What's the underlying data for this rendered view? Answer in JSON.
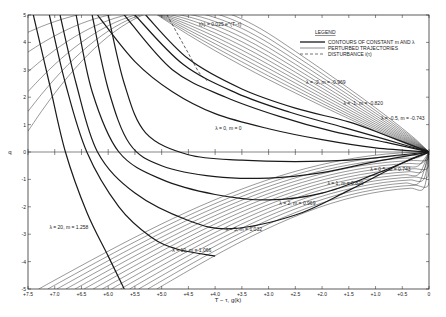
{
  "chart_data": {
    "type": "line",
    "title": "",
    "xlabel": "T − τ, g(k)",
    "ylabel": "q",
    "xlim": [
      7.5,
      0
    ],
    "ylim": [
      -5,
      5
    ],
    "x_ticks": [
      "+7.5",
      "+7.0",
      "+6.5",
      "+6.0",
      "+5.5",
      "+5.0",
      "+4.5",
      "+4.0",
      "+3.5",
      "+3.0",
      "+2.5",
      "+2.0",
      "+1.5",
      "+1.0",
      "+0.5",
      "0"
    ],
    "x_tick_values": [
      7.5,
      7.0,
      6.5,
      6.0,
      5.5,
      5.0,
      4.5,
      4.0,
      3.5,
      3.0,
      2.5,
      2.0,
      1.5,
      1.0,
      0.5,
      0
    ],
    "y_ticks": [
      "5",
      "4",
      "3",
      "2",
      "1",
      "0",
      "-1",
      "-2",
      "-3",
      "-4",
      "-5"
    ],
    "y_tick_values": [
      5,
      4,
      3,
      2,
      1,
      0,
      -1,
      -2,
      -3,
      -4,
      -5
    ],
    "grid": false,
    "legend": {
      "title": "LEGEND",
      "position": "upper right",
      "entries": [
        {
          "label": "CONTOURS OF CONSTANT m AND λ",
          "style": "thick-solid"
        },
        {
          "label": "PERTURBED TRAJECTORIES",
          "style": "thin-solid"
        },
        {
          "label": "DISTURBANCE i(τ)",
          "style": "dashed"
        }
      ]
    },
    "annotations": [
      {
        "text": "i(τ) = 0.025 e^(T−τ)",
        "x": 4.3,
        "y": 4.6
      },
      {
        "text": "λ = -2, m = -0.969",
        "x": 2.3,
        "y": 2.5
      },
      {
        "text": "λ = -1, m = -0.820",
        "x": 1.6,
        "y": 1.7
      },
      {
        "text": "λ = -0.5, m = -0.743",
        "x": 0.9,
        "y": 1.15
      },
      {
        "text": "λ = 0, m = 0",
        "x": 4.0,
        "y": 0.8
      },
      {
        "text": "λ = 0.5, m = 0.743",
        "x": 1.1,
        "y": -0.7
      },
      {
        "text": "λ = 1, m = 0.820",
        "x": 1.9,
        "y": -1.2
      },
      {
        "text": "λ = 2, m = 0.969",
        "x": 2.8,
        "y": -1.95
      },
      {
        "text": "λ = 5, m = 1.032",
        "x": 3.8,
        "y": -2.9
      },
      {
        "text": "λ = 10, m = 1.066",
        "x": 4.8,
        "y": -3.65
      },
      {
        "text": "λ = 20, m = 1.258",
        "x": 7.1,
        "y": -2.8
      }
    ],
    "series": [
      {
        "name": "λ = -0.5, m = -0.743",
        "kind": "contour",
        "x": [
          5.3,
          4.5,
          3.5,
          2.5,
          1.5,
          0.8,
          0
        ],
        "y": [
          5,
          3.4,
          2.3,
          1.6,
          1.1,
          0.6,
          0
        ]
      },
      {
        "name": "λ = -1, m = -0.820",
        "kind": "contour",
        "x": [
          5.5,
          4.6,
          3.6,
          2.6,
          1.6,
          0.8,
          0
        ],
        "y": [
          5,
          3.2,
          2.15,
          1.45,
          0.9,
          0.45,
          0
        ]
      },
      {
        "name": "λ = -2, m = -0.969",
        "kind": "contour",
        "x": [
          5.7,
          4.8,
          3.8,
          2.8,
          1.8,
          0.8,
          0
        ],
        "y": [
          5,
          3.0,
          2.0,
          1.3,
          0.75,
          0.35,
          0
        ]
      },
      {
        "name": "λ = 0, m = 0",
        "kind": "contour",
        "x": [
          6.2,
          5.5,
          4.8,
          4.0,
          3.0,
          2.0,
          1.0,
          0
        ],
        "y": [
          5,
          3.3,
          2.2,
          1.4,
          0.85,
          0.45,
          0.15,
          0
        ]
      },
      {
        "name": "λ = 0.5, m = 0.743",
        "kind": "contour",
        "x": [
          6.0,
          5.7,
          5.3,
          4.5,
          3.5,
          2.5,
          1.5,
          0.5,
          0
        ],
        "y": [
          5,
          2.5,
          0.7,
          -0.1,
          -0.3,
          -0.35,
          -0.3,
          -0.1,
          0
        ]
      },
      {
        "name": "λ = 1, m = 0.820",
        "kind": "contour",
        "x": [
          6.3,
          6.0,
          5.6,
          5.0,
          4.0,
          3.0,
          2.0,
          1.0,
          0
        ],
        "y": [
          5,
          2.3,
          0.3,
          -0.5,
          -0.9,
          -0.95,
          -0.75,
          -0.35,
          0
        ]
      },
      {
        "name": "λ = 2, m = 0.969",
        "kind": "contour",
        "x": [
          6.6,
          6.3,
          5.8,
          5.0,
          4.0,
          3.0,
          2.0,
          1.0,
          0
        ],
        "y": [
          5,
          2.2,
          0,
          -1.0,
          -1.55,
          -1.75,
          -1.5,
          -0.8,
          0
        ]
      },
      {
        "name": "λ = 5, m = 1.032",
        "kind": "contour",
        "x": [
          6.9,
          6.6,
          6.2,
          5.5,
          4.5,
          3.7,
          2.5,
          1.5,
          0.5,
          0
        ],
        "y": [
          5,
          2.5,
          0,
          -1.5,
          -2.5,
          -2.8,
          -2.3,
          -1.4,
          -0.4,
          0
        ]
      },
      {
        "name": "λ = 10, m = 1.066",
        "kind": "contour",
        "x": [
          7.1,
          6.8,
          6.4,
          5.8,
          5.2,
          4.7,
          4.0
        ],
        "y": [
          5,
          2.5,
          0,
          -2.0,
          -3.1,
          -3.55,
          -3.8
        ]
      },
      {
        "name": "λ = 20, m = 1.258",
        "kind": "contour",
        "x": [
          7.4,
          7.1,
          6.8,
          6.4,
          6.0,
          5.7
        ],
        "y": [
          5,
          2.5,
          0,
          -2.2,
          -3.8,
          -5
        ]
      },
      {
        "name": "disturbance i(τ)",
        "kind": "disturbance",
        "x": [
          4.9,
          4.7,
          4.5,
          4.3,
          4.15
        ],
        "y": [
          5,
          4.3,
          3.6,
          2.9,
          2.6
        ]
      }
    ]
  },
  "legend": {
    "title": "LEGEND",
    "items": [
      "CONTOURS OF CONSTANT m AND λ",
      "PERTURBED TRAJECTORIES",
      "DISTURBANCE i(τ)"
    ]
  },
  "axes": {
    "xlabel": "T − τ, g(k)",
    "ylabel": "q"
  },
  "colors": {
    "ink": "#1a1a1a",
    "paper": "#ffffff",
    "axis": "#333333"
  }
}
